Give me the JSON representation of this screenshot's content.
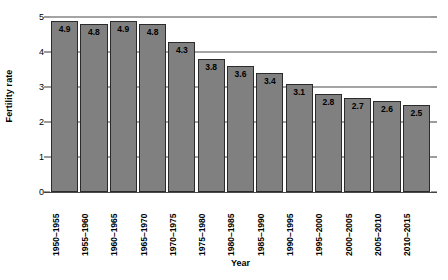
{
  "chart_data": {
    "type": "bar",
    "title": "",
    "xlabel": "Year",
    "ylabel": "Fertility rate",
    "ylim": [
      0,
      5
    ],
    "ytick_step": 1,
    "yticks": [
      "0",
      "1",
      "2",
      "3",
      "4",
      "5"
    ],
    "grid": true,
    "legend": "none",
    "bar_color": "#808080",
    "bar_border_color": "#2b2b2b",
    "axis_color": "#4a4a4a",
    "categories": [
      "1950–1955",
      "1955–1960",
      "1960–1965",
      "1965–1970",
      "1970–1975",
      "1975–1980",
      "1980–1985",
      "1985–1990",
      "1990–1995",
      "1995–2000",
      "2000–2005",
      "2005–2010",
      "2010–2015"
    ],
    "values": [
      4.9,
      4.8,
      4.9,
      4.8,
      4.3,
      3.8,
      3.6,
      3.4,
      3.1,
      2.8,
      2.7,
      2.6,
      2.5
    ],
    "value_labels": [
      "4.9",
      "4.8",
      "4.9",
      "4.8",
      "4.3",
      "3.8",
      "3.6",
      "3.4",
      "3.1",
      "2.8",
      "2.7",
      "2.6",
      "2.5"
    ]
  }
}
